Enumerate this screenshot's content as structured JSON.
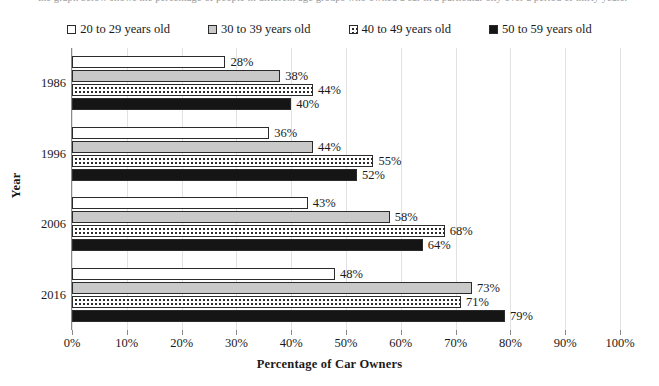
{
  "caption": {
    "text": "the graph below shows the percentage of people in different age groups who owned a car in a particular city over a period of thirty years."
  },
  "legend": {
    "position": "top",
    "items": [
      {
        "label": "20 to 29 years old",
        "swatch": "open-square-icon",
        "fill": "open",
        "color": "#ffffff"
      },
      {
        "label": "30 to 39 years old",
        "swatch": "gray-square-icon",
        "fill": "gray",
        "color": "#c9c9c9"
      },
      {
        "label": "40 to 49 years old",
        "swatch": "dotted-square-icon",
        "fill": "dot",
        "color": "#ffffff"
      },
      {
        "label": "50 to 59 years old",
        "swatch": "black-square-icon",
        "fill": "black",
        "color": "#151515"
      }
    ]
  },
  "axes": {
    "x_title": "Percentage of Car Owners",
    "y_title": "Year",
    "x_ticks": [
      "0%",
      "10%",
      "20%",
      "30%",
      "40%",
      "50%",
      "60%",
      "70%",
      "80%",
      "90%",
      "100%"
    ],
    "y_ticks": [
      "1986",
      "1996",
      "2006",
      "2016"
    ]
  },
  "chart_data": {
    "type": "bar",
    "orientation": "horizontal",
    "title": "",
    "subtitle": "",
    "xlabel": "Percentage of Car Owners",
    "ylabel": "Year",
    "xlim": [
      0,
      100
    ],
    "xticks": [
      0,
      10,
      20,
      30,
      40,
      50,
      60,
      70,
      80,
      90,
      100
    ],
    "xtick_labels": [
      "0%",
      "10%",
      "20%",
      "30%",
      "40%",
      "50%",
      "60%",
      "70%",
      "80%",
      "90%",
      "100%"
    ],
    "grid": true,
    "grid_axis": "x",
    "legend_position": "top",
    "value_label_suffix": "%",
    "categories": [
      "1986",
      "1996",
      "2006",
      "2016"
    ],
    "series": [
      {
        "name": "20 to 29 years old",
        "fill": "open",
        "values": [
          28,
          36,
          43,
          48
        ],
        "labels": [
          "28%",
          "36%",
          "43%",
          "48%"
        ]
      },
      {
        "name": "30 to 39 years old",
        "fill": "gray",
        "values": [
          38,
          44,
          58,
          73
        ],
        "labels": [
          "38%",
          "44%",
          "58%",
          "73%"
        ]
      },
      {
        "name": "40 to 49 years old",
        "fill": "dot",
        "values": [
          44,
          55,
          68,
          71
        ],
        "labels": [
          "44%",
          "55%",
          "68%",
          "71%"
        ]
      },
      {
        "name": "50 to 59 years old",
        "fill": "black",
        "values": [
          40,
          52,
          64,
          79
        ],
        "labels": [
          "40%",
          "52%",
          "64%",
          "79%"
        ]
      }
    ]
  }
}
